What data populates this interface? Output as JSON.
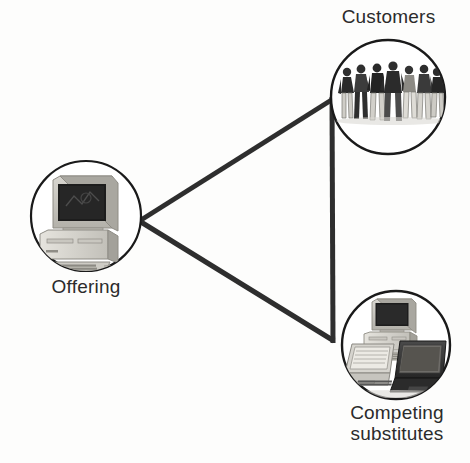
{
  "diagram": {
    "type": "triangle-relationship-diagram",
    "background_color": "#fdfdfc",
    "line_color": "#2e2e2e",
    "circle_stroke_color": "#1a1a1a",
    "label_color": "#2b2b2b",
    "nodes": [
      {
        "id": "offering",
        "label": "Offering",
        "icon": "desktop-computer-icon",
        "icon_description": "Beige CRT monitor on a horizontal desktop case with keyboard and mouse",
        "center_x": 86,
        "center_y": 216,
        "radius": 56
      },
      {
        "id": "customers",
        "label": "Customers",
        "icon": "group-of-people-icon",
        "icon_description": "Row of seven standing people in jackets and trousers",
        "person_count": 7,
        "center_x": 388,
        "center_y": 97,
        "radius": 58
      },
      {
        "id": "competing-substitutes",
        "label": "Competing\nsubstitutes",
        "icon": "computers-and-laptops-icon",
        "icon_description": "Desktop computer above a light laptop and a dark laptop",
        "center_x": 396,
        "center_y": 345,
        "radius": 55
      }
    ],
    "edges": [
      {
        "id": "offering-to-customers",
        "from": "offering",
        "to": "customers"
      },
      {
        "id": "offering-to-competing-substitutes",
        "from": "offering",
        "to": "competing-substitutes"
      },
      {
        "id": "customers-to-competing-substitutes",
        "from": "customers",
        "to": "competing-substitutes"
      }
    ]
  }
}
